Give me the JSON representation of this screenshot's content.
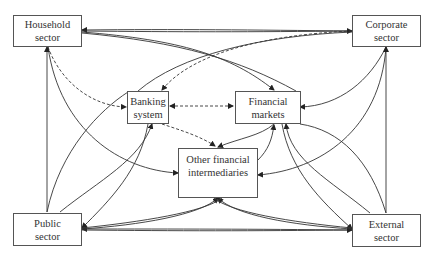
{
  "diagram": {
    "nodes": {
      "household": {
        "line1": "Household",
        "line2": "sector"
      },
      "corporate": {
        "line1": "Corporate",
        "line2": "sector"
      },
      "banking": {
        "line1": "Banking",
        "line2": "system"
      },
      "markets": {
        "line1": "Financial",
        "line2": "markets"
      },
      "ofi": {
        "line1": "Other financial",
        "line2": "intermediaries"
      },
      "public": {
        "line1": "Public",
        "line2": "sector"
      },
      "external": {
        "line1": "External",
        "line2": "sector"
      }
    },
    "edges": [
      {
        "from": "corporate",
        "to": "household",
        "style": "solid"
      },
      {
        "from": "household",
        "to": "corporate",
        "style": "solid"
      },
      {
        "from": "household",
        "to": "markets",
        "style": "solid"
      },
      {
        "from": "corporate",
        "to": "banking",
        "style": "dashed"
      },
      {
        "from": "household",
        "to": "banking",
        "style": "dashed"
      },
      {
        "from": "banking",
        "to": "markets",
        "style": "dashed-bidirectional"
      },
      {
        "from": "banking",
        "to": "ofi",
        "style": "dashed"
      },
      {
        "from": "markets",
        "to": "ofi",
        "style": "solid-bidirectional"
      },
      {
        "from": "corporate",
        "to": "markets",
        "style": "solid"
      },
      {
        "from": "public",
        "to": "household",
        "style": "solid"
      },
      {
        "from": "external",
        "to": "corporate",
        "style": "solid"
      },
      {
        "from": "external",
        "to": "public",
        "style": "solid"
      },
      {
        "from": "public",
        "to": "external",
        "style": "solid"
      },
      {
        "from": "public",
        "to": "ofi",
        "style": "solid"
      },
      {
        "from": "external",
        "to": "ofi",
        "style": "solid"
      }
    ],
    "colors": {
      "line": "#333333",
      "border": "#555555",
      "text": "#333333"
    }
  }
}
